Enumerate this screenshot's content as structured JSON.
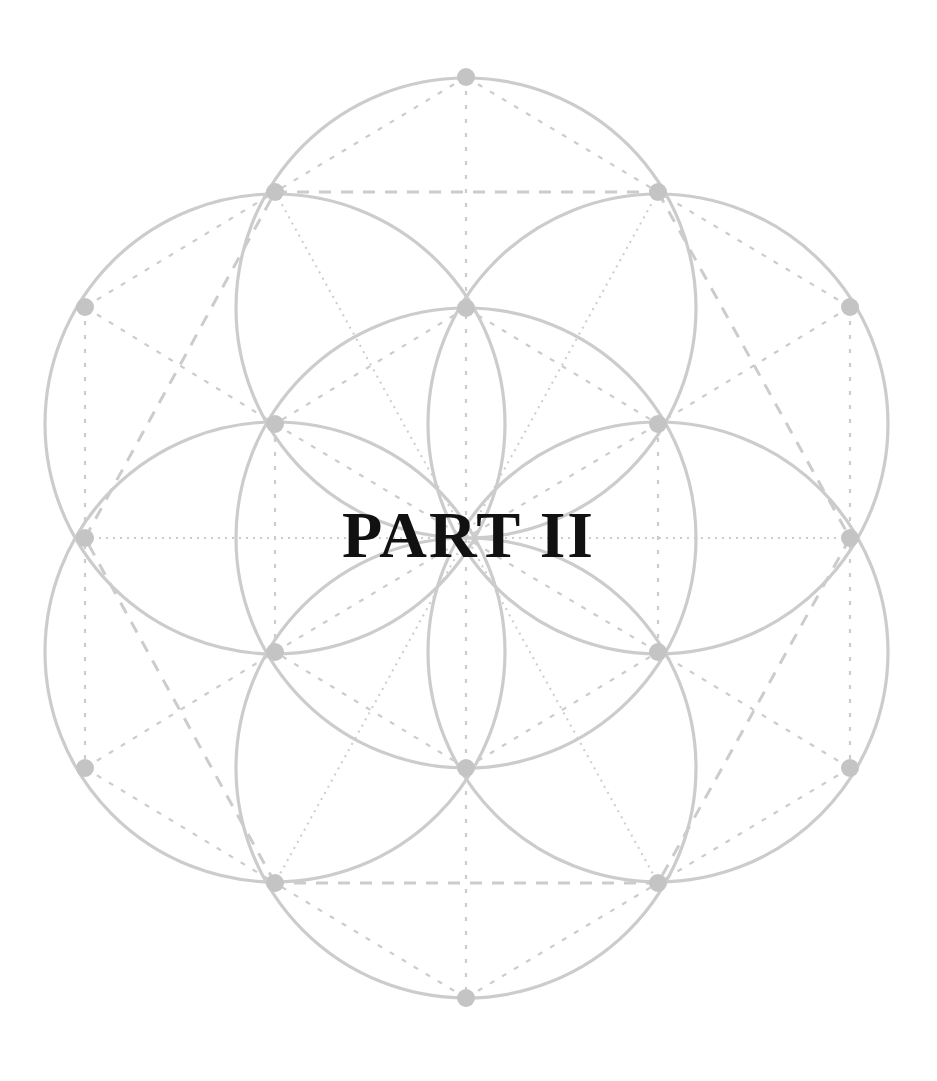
{
  "page": {
    "title": "PART II"
  },
  "geometry": {
    "name": "Seed of Life",
    "center": [
      466,
      538
    ],
    "circle_radius": 230,
    "line_color": "#c9c9c9",
    "node_color": "#c4c4c4",
    "background": "#ffffff",
    "title_color": "#111111"
  }
}
